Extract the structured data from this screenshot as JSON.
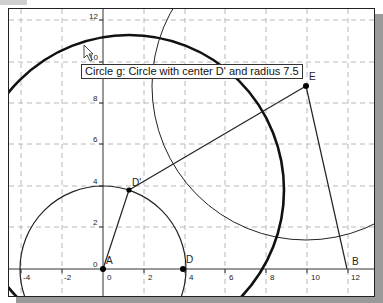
{
  "view": {
    "origin_px": [
      102,
      268
    ],
    "unit_px_x": 20.4,
    "unit_px_y": 20.75
  },
  "axes": {
    "x_ticks": [
      "-4",
      "-2",
      "0",
      "2",
      "4",
      "6",
      "8",
      "10",
      "12"
    ],
    "y_ticks": [
      "0",
      "2",
      "4",
      "6",
      "8",
      "10",
      "12"
    ]
  },
  "points": [
    {
      "name": "A",
      "label": "A",
      "coords": [
        0,
        0
      ]
    },
    {
      "name": "D",
      "label": "D",
      "coords": [
        4,
        0
      ]
    },
    {
      "name": "D'",
      "label": "D'",
      "coords": [
        1.25,
        3.8
      ]
    },
    {
      "name": "E",
      "label": "E",
      "coords": [
        10,
        8.8
      ]
    },
    {
      "name": "B",
      "label": "B",
      "coords": [
        11.9,
        0
      ]
    }
  ],
  "circles": [
    {
      "name": "small",
      "center": "A",
      "radius": 4
    },
    {
      "name": "g",
      "center": "D'",
      "radius": 7.5
    },
    {
      "name": "thin",
      "center": "E",
      "radius": 7.5
    }
  ],
  "segments": [
    [
      "A",
      "D'"
    ],
    [
      "D'",
      "E"
    ],
    [
      "E",
      "B"
    ]
  ],
  "tooltip": {
    "text": "Circle g: Circle with center D' and radius 7.5"
  },
  "colors": {
    "line": "#222222",
    "grid": "#b8b8b8",
    "point": "#000000"
  }
}
